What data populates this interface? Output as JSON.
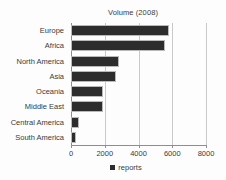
{
  "chart_data": {
    "type": "bar",
    "orientation": "horizontal",
    "title": "Volume (2008)",
    "xlabel": "",
    "ylabel": "",
    "categories": [
      "Europe",
      "Africa",
      "North America",
      "Asia",
      "Oceania",
      "Middle East",
      "Central America",
      "South America"
    ],
    "values": [
      5800,
      5550,
      2850,
      2650,
      1900,
      1900,
      470,
      300
    ],
    "series": [
      {
        "name": "reports",
        "values": [
          5800,
          5550,
          2850,
          2650,
          1900,
          1900,
          470,
          300
        ]
      }
    ],
    "xlim": [
      0,
      8050
    ],
    "xticks": [
      0,
      2000,
      4000,
      6000,
      8000
    ],
    "xtick_labels": [
      "0",
      "2000",
      "4000",
      "6000",
      "8000"
    ],
    "grid": "vertical",
    "legend": {
      "position": "bottom",
      "entries": [
        {
          "label": "reports",
          "color": "#2d2d2d"
        }
      ]
    },
    "bar_color": "#2d2d2d",
    "background_color": "#fdfdfd",
    "axis_color": "#8e8e8e",
    "gridline_color": "#c9c9c9",
    "text_color": "#3a3a3a"
  }
}
